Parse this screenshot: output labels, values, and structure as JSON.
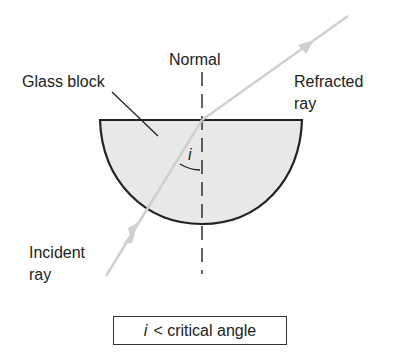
{
  "diagram": {
    "labels": {
      "normal": "Normal",
      "glass_block": "Glass block",
      "refracted_ray_line1": "Refracted",
      "refracted_ray_line2": "ray",
      "incident_ray_line1": "Incident",
      "incident_ray_line2": "ray",
      "angle_symbol": "i"
    },
    "caption": {
      "variable": "i",
      "text": "< critical angle"
    },
    "colors": {
      "block_fill": "#e8e8e8",
      "outline": "#222222",
      "ray": "#cfcfcf",
      "background": "#ffffff"
    }
  }
}
